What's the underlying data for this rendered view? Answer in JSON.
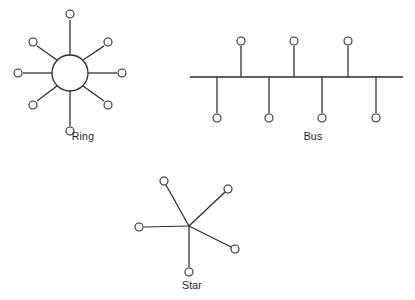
{
  "figure": {
    "background_color": "#ffffff",
    "line_color": "#2b2b2b",
    "node_fill": "#ffffff",
    "width": 415,
    "height": 300
  },
  "diagrams": [
    {
      "id": "ring",
      "label": "Ring",
      "label_x": 83,
      "label_y": 140,
      "hub": {
        "cx": 70,
        "cy": 73,
        "r": 18
      },
      "spokes": [
        {
          "name": "ring-node-n",
          "angle": 270,
          "node_x": 70,
          "node_y": 14,
          "line_x1": 70,
          "line_y1": 55,
          "line_x2": 70,
          "line_y2": 20
        },
        {
          "name": "ring-node-ne",
          "angle": 315,
          "node_x": 108,
          "node_y": 42,
          "line_x1": 83,
          "line_y1": 60,
          "line_x2": 104,
          "line_y2": 46
        },
        {
          "name": "ring-node-e",
          "angle": 0,
          "node_x": 122,
          "node_y": 73,
          "line_x1": 88,
          "line_y1": 73,
          "line_x2": 117,
          "line_y2": 73
        },
        {
          "name": "ring-node-se",
          "angle": 45,
          "node_x": 108,
          "node_y": 105,
          "line_x1": 83,
          "line_y1": 86,
          "line_x2": 104,
          "line_y2": 101
        },
        {
          "name": "ring-node-s",
          "angle": 90,
          "node_x": 70,
          "node_y": 131,
          "line_x1": 70,
          "line_y1": 91,
          "line_x2": 70,
          "line_y2": 126
        },
        {
          "name": "ring-node-sw",
          "angle": 135,
          "node_x": 33,
          "node_y": 105,
          "line_x1": 57,
          "line_y1": 86,
          "line_x2": 37,
          "line_y2": 101
        },
        {
          "name": "ring-node-w",
          "angle": 180,
          "node_x": 18,
          "node_y": 73,
          "line_x1": 52,
          "line_y1": 73,
          "line_x2": 23,
          "line_y2": 73
        },
        {
          "name": "ring-node-nw",
          "angle": 225,
          "node_x": 33,
          "node_y": 42,
          "line_x1": 57,
          "line_y1": 60,
          "line_x2": 37,
          "line_y2": 46
        }
      ],
      "node_radius": 4
    },
    {
      "id": "bus",
      "label": "Bus",
      "label_x": 313,
      "label_y": 140,
      "backbone": {
        "x1": 190,
        "y1": 77,
        "x2": 403,
        "y2": 77
      },
      "stubs_up": [
        {
          "name": "bus-node-up-1",
          "x": 241,
          "node_y": 41,
          "stub_y1": 77,
          "stub_y2": 46
        },
        {
          "name": "bus-node-up-2",
          "x": 294,
          "node_y": 41,
          "stub_y1": 77,
          "stub_y2": 46
        },
        {
          "name": "bus-node-up-3",
          "x": 348,
          "node_y": 41,
          "stub_y1": 77,
          "stub_y2": 46
        }
      ],
      "stubs_down": [
        {
          "name": "bus-node-down-1",
          "x": 217,
          "node_y": 118,
          "stub_y1": 77,
          "stub_y2": 113
        },
        {
          "name": "bus-node-down-2",
          "x": 269,
          "node_y": 118,
          "stub_y1": 77,
          "stub_y2": 113
        },
        {
          "name": "bus-node-down-3",
          "x": 322,
          "node_y": 118,
          "stub_y1": 77,
          "stub_y2": 113
        },
        {
          "name": "bus-node-down-4",
          "x": 376,
          "node_y": 118,
          "stub_y1": 77,
          "stub_y2": 113
        }
      ],
      "node_radius": 4
    },
    {
      "id": "star",
      "label": "Star",
      "label_x": 192,
      "label_y": 289,
      "hub": {
        "cx": 189,
        "cy": 226
      },
      "spokes": [
        {
          "name": "star-node-upper-left",
          "node_x": 164,
          "node_y": 181,
          "line_x1": 189,
          "line_y1": 226,
          "line_x2": 166,
          "line_y2": 185
        },
        {
          "name": "star-node-upper-right",
          "node_x": 228,
          "node_y": 189,
          "line_x1": 189,
          "line_y1": 226,
          "line_x2": 225,
          "line_y2": 192
        },
        {
          "name": "star-node-left",
          "node_x": 139,
          "node_y": 227,
          "line_x1": 189,
          "line_y1": 226,
          "line_x2": 144,
          "line_y2": 227
        },
        {
          "name": "star-node-lower-right",
          "node_x": 235,
          "node_y": 249,
          "line_x1": 189,
          "line_y1": 226,
          "line_x2": 231,
          "line_y2": 247
        },
        {
          "name": "star-node-bottom",
          "node_x": 189,
          "node_y": 272,
          "line_x1": 189,
          "line_y1": 226,
          "line_x2": 189,
          "line_y2": 267
        }
      ],
      "node_radius": 4
    }
  ],
  "chart_data": {
    "type": "diagram",
    "topologies": [
      {
        "name": "Ring",
        "node_count": 8,
        "has_central_hub": true,
        "description": "Central circular hub with eight radial spokes terminating in open-circle nodes"
      },
      {
        "name": "Bus",
        "node_count": 7,
        "has_central_hub": false,
        "description": "Horizontal backbone line with three stub drops above and four stub drops below, each ending in an open-circle node"
      },
      {
        "name": "Star",
        "node_count": 5,
        "has_central_hub": true,
        "description": "Single central junction point with five straight spokes radiating outward to open-circle nodes"
      }
    ]
  }
}
